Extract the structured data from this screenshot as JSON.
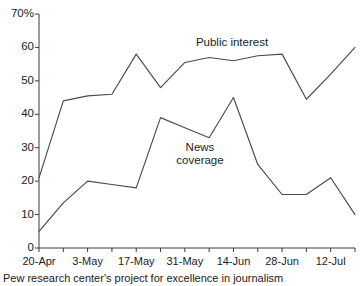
{
  "figure": {
    "clipped_header": "",
    "source_note": "Pew research center's project for excellence in journalism",
    "y_axis_top_label": "70%"
  },
  "labels": {
    "public_interest": "Public interest",
    "news_coverage_line1": "News",
    "news_coverage_line2": "coverage"
  },
  "chart_data": {
    "type": "line",
    "title": "",
    "xlabel": "",
    "ylabel": "",
    "ylim": [
      0,
      70
    ],
    "ytick_labels": [
      "0",
      "10",
      "20",
      "30",
      "40",
      "50",
      "60",
      "70%"
    ],
    "yticks": [
      0,
      10,
      20,
      30,
      40,
      50,
      60,
      70
    ],
    "grid": false,
    "legend": "inline-annotations",
    "x": [
      "20-Apr",
      "27-Apr",
      "3-May",
      "10-May",
      "17-May",
      "24-May",
      "31-May",
      "7-Jun",
      "14-Jun",
      "21-Jun",
      "28-Jun",
      "5-Jul",
      "12-Jul",
      "19-Jul"
    ],
    "xtick_labels": [
      "20-Apr",
      "3-May",
      "17-May",
      "31-May",
      "14-Jun",
      "28-Jun",
      "12-Jul"
    ],
    "series": [
      {
        "name": "Public interest",
        "values": [
          21,
          44,
          45.5,
          46,
          58,
          48,
          55.5,
          57,
          56,
          57.5,
          58,
          44.5,
          52,
          60
        ]
      },
      {
        "name": "News coverage",
        "values": [
          5,
          13.5,
          20,
          19,
          18,
          39,
          36,
          33,
          45,
          25,
          16,
          16,
          21,
          10
        ]
      }
    ]
  },
  "colors": {
    "line": "#4a4a4a",
    "axis": "#3a3a3a",
    "text": "#1b1b1b",
    "background": "#ffffff"
  }
}
